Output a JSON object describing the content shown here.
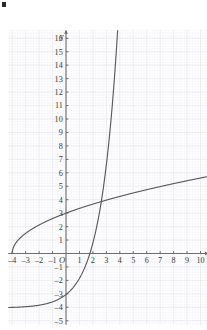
{
  "figure": {
    "corner_mark": "b",
    "axis_label_y": "y",
    "origin_label": "O",
    "background_color": "#ffffff",
    "grid_color": "#e8e8ee",
    "grid_minor_color": "#f2f2f6",
    "axis_color": "#6b6b72",
    "curve_color": "#5a5a60",
    "tick_label_color": "#3a3a3a"
  },
  "chart_data": {
    "type": "line",
    "title": "",
    "xlabel": "",
    "ylabel": "y",
    "xlim": [
      -4.3,
      10.6
    ],
    "ylim": [
      -5.3,
      16.6
    ],
    "grid": true,
    "minor_grid_divisions": 5,
    "legend": "none",
    "x_ticks": [
      -4,
      -3,
      -2,
      -1,
      1,
      2,
      3,
      4,
      5,
      6,
      7,
      8,
      9,
      10
    ],
    "x_tick_labels": [
      "–4",
      "–3",
      "–2",
      "–1",
      "1",
      "2",
      "3",
      "4",
      "5",
      "6",
      "7",
      "8",
      "9",
      "10"
    ],
    "y_ticks": [
      -5,
      -4,
      -3,
      -2,
      -1,
      1,
      2,
      3,
      4,
      5,
      6,
      7,
      8,
      9,
      10,
      11,
      12,
      13,
      14,
      15,
      16
    ],
    "y_tick_labels": [
      "–5",
      "–4",
      "–3",
      "–2",
      "–1",
      "1",
      "2",
      "3",
      "4",
      "5",
      "6",
      "7",
      "8",
      "9",
      "10",
      "11",
      "12",
      "13",
      "14",
      "15",
      "16"
    ],
    "series": [
      {
        "name": "square-root-curve",
        "equation": "y = sqrt(x + 4) + 1",
        "x": [
          -4,
          -3.75,
          -3.5,
          -3.25,
          -3,
          -2.5,
          -2,
          -1.5,
          -1,
          -0.5,
          0,
          0.5,
          1,
          1.5,
          2,
          2.5,
          3,
          3.5,
          4,
          5,
          6,
          7,
          8,
          9,
          10
        ],
        "y": [
          0,
          1.5,
          1.71,
          1.87,
          2,
          2.22,
          2.41,
          2.58,
          2.73,
          2.87,
          3,
          3.12,
          3.24,
          3.35,
          3.45,
          3.55,
          3.65,
          3.74,
          3.83,
          4,
          4.16,
          4.32,
          4.46,
          4.61,
          4.74
        ]
      },
      {
        "name": "exponential-curve",
        "equation": "y = 2^x − 4",
        "asymptote_y": -4,
        "x_intercept": 2,
        "x": [
          -4,
          -3,
          -2,
          -1,
          0,
          0.5,
          1,
          1.5,
          2,
          2.5,
          3,
          3.5,
          4,
          4.5,
          5,
          5.5,
          6,
          6.32
        ],
        "y": [
          -3.94,
          -3.88,
          -3.75,
          -3.5,
          -3,
          -2.59,
          -2,
          -1.17,
          0,
          1.66,
          4,
          7.31,
          12,
          18.6,
          28,
          41.3,
          60,
          76
        ]
      }
    ],
    "intersection_points": [
      [
        4,
        4.1
      ]
    ]
  }
}
